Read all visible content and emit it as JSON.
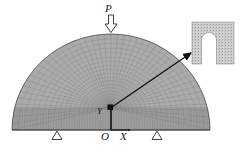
{
  "figure": {
    "background_color": "#ffffff",
    "ink_color": "#1a1a1a",
    "mesh_color": "#8d8d8d",
    "mesh_fill": "#a9a9a9",
    "inset_fill": "#d8d8d8"
  },
  "labels": {
    "load": "P",
    "axis_y": "Y",
    "origin": "O",
    "axis_x": "X"
  },
  "icons": {
    "load_arrow": "down-arrow-outline-icon",
    "support_left": "triangle-support-icon",
    "support_right": "triangle-support-icon",
    "leader": "leader-arrow-icon",
    "defect": "defect-square-icon"
  },
  "geometry": {
    "dome_center_x": 111,
    "dome_baseline_y": 130,
    "dome_radius_x": 99,
    "dome_radius_y": 96,
    "apex_y": 34,
    "left_edge_x": 12,
    "right_edge_x": 210,
    "defect_x": 110,
    "defect_y": 108,
    "inset_x": 192,
    "inset_y": 22,
    "inset_size": 42,
    "support_left_x": 57,
    "support_right_x": 157,
    "leader_from": [
      112,
      108
    ],
    "leader_to": [
      193,
      53
    ],
    "radial_rays": 46,
    "radial_rings": 22,
    "base_layers": 5
  }
}
